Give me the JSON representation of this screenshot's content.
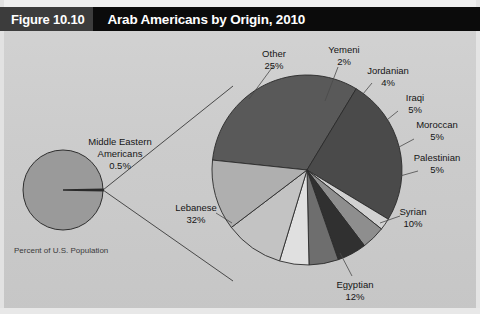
{
  "header": {
    "figure_number": "Figure 10.10",
    "title": "Arab Americans by Origin, 2010"
  },
  "footnote": "Percent of U.S. Population",
  "inset": {
    "label_line1": "Middle Eastern",
    "label_line2": "Americans",
    "value": "0.5%"
  },
  "colors": {
    "background": "#cccccc",
    "title_bar": "#0b0b0b",
    "figure_number_box": "#3c3c3c",
    "title_text": "#ffffff",
    "slice_outline": "#2a2a2a",
    "inset_pie": "#9a9a9a",
    "inset_sliver": "#2a2a2a"
  },
  "chart_data": {
    "type": "pie",
    "title": "Arab Americans by Origin, 2010",
    "subtitle": "Percent of U.S. Population",
    "units": "percent",
    "total": 100,
    "categories": [
      "Lebanese",
      "Other",
      "Yemeni",
      "Jordanian",
      "Iraqi",
      "Moroccan",
      "Palestinian",
      "Syrian",
      "Egyptian"
    ],
    "values": [
      32,
      25,
      2,
      4,
      5,
      5,
      5,
      10,
      12
    ],
    "slices": [
      {
        "name": "Lebanese",
        "value": 32,
        "label": "Lebanese",
        "value_label": "32%",
        "color": "#595959",
        "label_x": 196,
        "label_y": 180,
        "label_anchor": "middle"
      },
      {
        "name": "Other",
        "value": 25,
        "label": "Other",
        "value_label": "25%",
        "color": "#4a4a4a",
        "label_x": 274,
        "label_y": 26,
        "label_anchor": "middle"
      },
      {
        "name": "Yemeni",
        "value": 2,
        "label": "Yemeni",
        "value_label": "2%",
        "color": "#d2d2d2",
        "label_x": 344,
        "label_y": 22,
        "label_anchor": "middle"
      },
      {
        "name": "Jordanian",
        "value": 4,
        "label": "Jordanian",
        "value_label": "4%",
        "color": "#8e8e8e",
        "label_x": 388,
        "label_y": 43,
        "label_anchor": "middle"
      },
      {
        "name": "Iraqi",
        "value": 5,
        "label": "Iraqi",
        "value_label": "5%",
        "color": "#303030",
        "label_x": 415,
        "label_y": 70,
        "label_anchor": "middle"
      },
      {
        "name": "Moroccan",
        "value": 5,
        "label": "Moroccan",
        "value_label": "5%",
        "color": "#6e6e6e",
        "label_x": 437,
        "label_y": 97,
        "label_anchor": "middle"
      },
      {
        "name": "Palestinian",
        "value": 5,
        "label": "Palestinian",
        "value_label": "5%",
        "color": "#e0e0e0",
        "label_x": 437,
        "label_y": 130,
        "label_anchor": "middle"
      },
      {
        "name": "Syrian",
        "value": 10,
        "label": "Syrian",
        "value_label": "10%",
        "color": "#c3c3c3",
        "label_x": 413,
        "label_y": 184,
        "label_anchor": "middle"
      },
      {
        "name": "Egyptian",
        "value": 12,
        "label": "Egyptian",
        "value_label": "12%",
        "color": "#afafaf",
        "label_x": 355,
        "label_y": 257,
        "label_anchor": "middle"
      }
    ],
    "inset_chart": {
      "type": "pie",
      "categories": [
        "Middle Eastern Americans",
        "Rest of U.S. Population"
      ],
      "values": [
        0.5,
        99.5
      ],
      "annotation": "Middle Eastern Americans 0.5%"
    },
    "legend": "none",
    "grid": false
  }
}
